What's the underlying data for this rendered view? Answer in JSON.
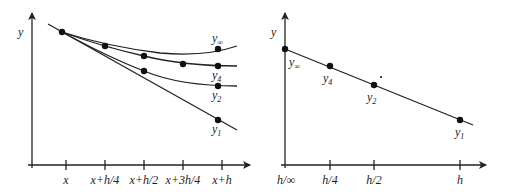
{
  "left_chart": {
    "y_axis_label": "y",
    "x_ticks": [
      "x",
      "x+h/4",
      "x+h/2",
      "x+3h/4",
      "x+h"
    ],
    "curve_labels": {
      "y_inf": {
        "base": "y",
        "sub": "∞"
      },
      "y4": {
        "base": "y",
        "sub": "4"
      },
      "y2": {
        "base": "y",
        "sub": "2"
      },
      "y1": {
        "base": "y",
        "sub": "1"
      }
    }
  },
  "right_chart": {
    "y_axis_label": "y",
    "x_ticks": [
      "h/∞",
      "h/4",
      "h/2",
      "h"
    ],
    "point_labels": {
      "y_inf": {
        "base": "y",
        "sub": "∞"
      },
      "y4": {
        "base": "y",
        "sub": "4"
      },
      "y2": {
        "base": "y",
        "sub": "2"
      },
      "y1": {
        "base": "y",
        "sub": "1"
      }
    }
  }
}
